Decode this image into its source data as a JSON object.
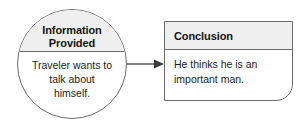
{
  "diagram": {
    "type": "flow-diagram",
    "orientation": "left-to-right",
    "nodes": [
      {
        "id": "information-provided",
        "shape": "circle",
        "header": {
          "lines": [
            "Information",
            "Provided"
          ],
          "bold": true,
          "align": "center",
          "fill": "#efefef"
        },
        "body": {
          "lines": [
            "Traveler wants to",
            "talk about",
            "himself."
          ],
          "align": "center",
          "fill": "#ffffff"
        }
      },
      {
        "id": "conclusion",
        "shape": "rounded-rect",
        "header": {
          "lines": [
            "Conclusion"
          ],
          "bold": true,
          "align": "left",
          "fill": "#efefef"
        },
        "body": {
          "lines": [
            "He thinks he is an",
            "important man."
          ],
          "align": "left",
          "fill": "#ffffff"
        }
      }
    ],
    "connectors": [
      {
        "id": "arrow-1",
        "from": "information-provided",
        "to": "conclusion",
        "style": "solid-line-with-filled-arrowhead",
        "direction": "right"
      }
    ],
    "colors": {
      "header_fill": "#efefef",
      "body_fill": "#ffffff",
      "stroke": "#6b6b6b",
      "text": "#141414",
      "arrow": "#3c3c3c",
      "background": "#ffffff"
    }
  }
}
